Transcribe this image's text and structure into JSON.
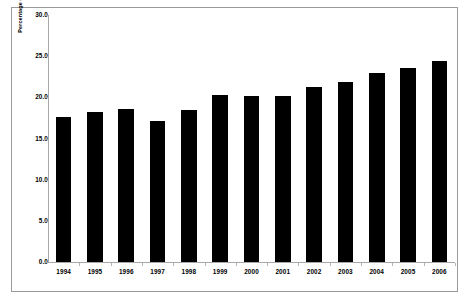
{
  "chart_data": {
    "type": "bar",
    "title": "",
    "xlabel": "",
    "ylabel": "Percentage of total trips",
    "categories": [
      "1994",
      "1995",
      "1996",
      "1997",
      "1998",
      "1999",
      "2000",
      "2001",
      "2002",
      "2003",
      "2004",
      "2005",
      "2006"
    ],
    "values": [
      17.6,
      18.2,
      18.6,
      17.1,
      18.5,
      20.3,
      20.2,
      20.2,
      21.3,
      21.9,
      22.9,
      23.6,
      24.4
    ],
    "ylim": [
      0.0,
      30.0
    ],
    "ytick_labels": [
      "0.0",
      "5.0",
      "10.0",
      "15.0",
      "20.0",
      "25.0",
      "30.0"
    ],
    "ytick_values": [
      0.0,
      5.0,
      10.0,
      15.0,
      20.0,
      25.0,
      30.0
    ],
    "grid": false,
    "legend": null,
    "bar_color": "#000000",
    "axis_color": "#a8a8a8",
    "frame": true
  },
  "axes": {
    "y_title": "Percentage of total trips"
  }
}
